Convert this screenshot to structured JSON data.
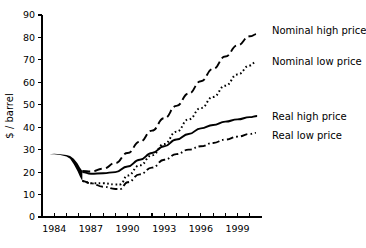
{
  "chart_data": {
    "type": "line",
    "title": "",
    "subtitle": "",
    "xlabel": "",
    "ylabel": "$ / barrel",
    "xlim": [
      1983,
      2001
    ],
    "ylim": [
      0,
      90
    ],
    "grid": false,
    "legend_position": "right-inline",
    "x_tick_labels": [
      "1984",
      "1987",
      "1990",
      "1993",
      "1996",
      "1999"
    ],
    "x_tick_values": [
      1984,
      1987,
      1990,
      1993,
      1996,
      1999
    ],
    "x_minor_tick_values": [
      1985,
      1986,
      1988,
      1989,
      1991,
      1992,
      1994,
      1995,
      1997,
      1998,
      2000
    ],
    "y_tick_labels": [
      "0",
      "10",
      "20",
      "30",
      "40",
      "50",
      "60",
      "70",
      "80",
      "90"
    ],
    "y_tick_values": [
      0,
      10,
      20,
      30,
      40,
      50,
      60,
      70,
      80,
      90
    ],
    "historical_band": {
      "name": "historical range",
      "x": [
        1983.6,
        1984.0,
        1984.5,
        1985.0,
        1985.3,
        1985.6,
        1985.9,
        1986.1,
        1986.3
      ],
      "upper": [
        28.0,
        28.2,
        28.0,
        27.6,
        27.2,
        26.0,
        24.0,
        22.0,
        20.5
      ],
      "lower": [
        28.0,
        28.0,
        27.6,
        27.0,
        26.0,
        23.5,
        20.5,
        18.0,
        16.0
      ]
    },
    "series": [
      {
        "name": "Nominal high price",
        "style": "dashed",
        "x": [
          1986.3,
          1987.0,
          1988.0,
          1989.0,
          1990.0,
          1991.0,
          1992.0,
          1993.0,
          1994.0,
          1995.0,
          1996.0,
          1997.0,
          1998.0,
          1999.0,
          2000.0,
          2000.6
        ],
        "values": [
          20.5,
          20.3,
          21.5,
          24.0,
          28.5,
          33.5,
          38.5,
          44.0,
          49.5,
          55.0,
          60.5,
          66.0,
          71.5,
          76.5,
          80.5,
          81.5
        ]
      },
      {
        "name": "Nominal low price",
        "style": "dotted",
        "x": [
          1986.3,
          1987.0,
          1988.0,
          1989.0,
          1989.4,
          1990.0,
          1991.0,
          1992.0,
          1993.0,
          1994.0,
          1995.0,
          1996.0,
          1997.0,
          1998.0,
          1999.0,
          2000.0,
          2000.5
        ],
        "values": [
          16.0,
          15.0,
          15.0,
          14.5,
          14.5,
          18.5,
          23.0,
          27.5,
          32.5,
          38.0,
          43.5,
          48.5,
          53.5,
          58.5,
          63.5,
          67.5,
          69.0
        ]
      },
      {
        "name": "Real high price",
        "style": "solid",
        "x": [
          1986.3,
          1987.0,
          1988.0,
          1989.0,
          1990.0,
          1991.0,
          1992.0,
          1993.0,
          1994.0,
          1995.0,
          1996.0,
          1997.0,
          1998.0,
          1999.0,
          2000.0,
          2000.6
        ],
        "values": [
          20.0,
          19.3,
          19.5,
          20.0,
          22.5,
          25.5,
          28.5,
          31.5,
          34.5,
          37.0,
          39.5,
          41.0,
          42.5,
          43.5,
          44.5,
          45.0
        ]
      },
      {
        "name": "Real low price",
        "style": "dashdot",
        "x": [
          1986.3,
          1987.0,
          1988.0,
          1989.0,
          1989.4,
          1990.0,
          1991.0,
          1992.0,
          1993.0,
          1994.0,
          1995.0,
          1996.0,
          1997.0,
          1998.0,
          1999.0,
          2000.0,
          2000.5
        ],
        "values": [
          16.0,
          15.0,
          13.5,
          12.5,
          12.5,
          15.5,
          19.0,
          22.0,
          25.5,
          28.0,
          30.0,
          31.5,
          33.0,
          34.5,
          35.8,
          37.0,
          37.5
        ]
      }
    ]
  },
  "legend": {
    "items": [
      {
        "label": "Nominal high price"
      },
      {
        "label": "Nominal low price"
      },
      {
        "label": "Real high price"
      },
      {
        "label": "Real low price"
      }
    ]
  },
  "colors": {
    "ink": "#000000",
    "background": "#ffffff"
  }
}
